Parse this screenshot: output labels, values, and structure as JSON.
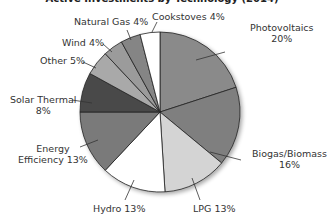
{
  "chart_data": {
    "type": "pie",
    "title": "Active Investments by Technology (2014)",
    "title_visible_fragment": "...by Technology (...)",
    "start_angle": "12 o'clock",
    "direction": "clockwise",
    "slices": [
      {
        "label": "Photovoltaics",
        "value": 20,
        "display": "20%",
        "color": "#8a8a8a"
      },
      {
        "label": "Biogas/Biomass",
        "value": 16,
        "display": "16%",
        "color": "#7f7f7f"
      },
      {
        "label": "LPG",
        "value": 13,
        "display": "13%",
        "color": "#d4d4d4"
      },
      {
        "label": "Hydro",
        "value": 13,
        "display": "13%",
        "color": "#ffffff"
      },
      {
        "label": "Energy Efficiency",
        "value": 13,
        "display": "13%",
        "color": "#7a7a7a"
      },
      {
        "label": "Solar Thermal",
        "value": 8,
        "display": "8%",
        "color": "#4a4a4a"
      },
      {
        "label": "Other",
        "value": 5,
        "display": "5%",
        "color": "#a9a9a9"
      },
      {
        "label": "Wind",
        "value": 4,
        "display": "4%",
        "color": "#9b9b9b"
      },
      {
        "label": "Natural Gas",
        "value": 4,
        "display": "4%",
        "color": "#858585"
      },
      {
        "label": "Cookstoves",
        "value": 4,
        "display": "4%",
        "color": "#ffffff"
      }
    ],
    "legend": "none (callout labels)"
  },
  "labels": {
    "photovoltaics": {
      "name": "Photovoltaics",
      "pct": "20%"
    },
    "biogas": {
      "name": "Biogas/Biomass",
      "pct": "16%"
    },
    "lpg": "LPG 13%",
    "hydro": "Hydro 13%",
    "energy_eff": {
      "line1": "Energy",
      "line2": "Efficiency 13%"
    },
    "solar_thermal": {
      "name": "Solar Thermal",
      "pct": "8%"
    },
    "other": "Other 5%",
    "wind": "Wind 4%",
    "natural_gas": "Natural Gas 4%",
    "cookstoves": "Cookstoves 4%"
  }
}
